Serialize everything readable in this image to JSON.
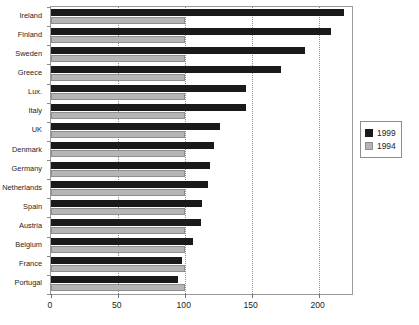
{
  "chart_data": {
    "type": "bar",
    "orientation": "horizontal",
    "title": "",
    "subtitle": "",
    "xlabel": "",
    "ylabel": "",
    "xlim": [
      0,
      225
    ],
    "xticks": [
      0,
      50,
      100,
      150,
      200
    ],
    "xtick_labels": [
      "0",
      "50",
      "100",
      "150",
      "200"
    ],
    "grid": "vertical-dotted-at-xticks",
    "legend_position": "right",
    "categories": [
      "Ireland",
      "Finland",
      "Sweden",
      "Greece",
      "Lux.",
      "Italy",
      "UK",
      "Denmark",
      "Germany",
      "Netherlands",
      "Spain",
      "Austria",
      "Belgium",
      "France",
      "Portugal"
    ],
    "series": [
      {
        "name": "1999",
        "color": "#1a1a1a",
        "values": [
          219,
          209,
          190,
          172,
          146,
          146,
          126,
          122,
          119,
          117,
          113,
          112,
          106,
          98,
          95
        ]
      },
      {
        "name": "1994",
        "color": "#b5b5b5",
        "values": [
          100,
          100,
          100,
          100,
          100,
          100,
          100,
          100,
          100,
          100,
          100,
          100,
          100,
          100,
          100
        ]
      }
    ]
  },
  "legend": {
    "entries": [
      {
        "label": "1999",
        "swatch": "dark"
      },
      {
        "label": "1994",
        "swatch": "light"
      }
    ]
  }
}
